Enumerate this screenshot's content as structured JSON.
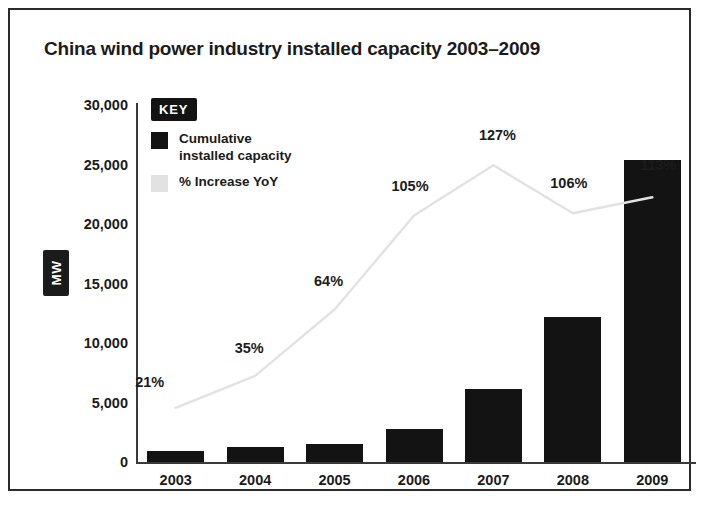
{
  "chart_data": {
    "type": "bar",
    "title": "China wind power industry installed capacity 2003–2009",
    "xlabel": "",
    "ylabel": "MW",
    "categories": [
      "2003",
      "2004",
      "2005",
      "2006",
      "2007",
      "2008",
      "2009"
    ],
    "ylim": [
      0,
      30000
    ],
    "yticks": [
      "30,000",
      "25,000",
      "20,000",
      "15,000",
      "10,000",
      "5,000",
      "0"
    ],
    "ytick_values": [
      30000,
      25000,
      20000,
      15000,
      10000,
      5000,
      0
    ],
    "grid": false,
    "legend_position": "inside-top-left",
    "series": [
      {
        "name": "Cumulative\ninstalled capacity",
        "type": "bar",
        "color": "#131313",
        "axis": "left",
        "values": [
          900,
          1250,
          1550,
          2800,
          6100,
          12200,
          25400
        ]
      },
      {
        "name": "% Increase YoY",
        "type": "line",
        "color": "#e2e2e2",
        "axis": "right",
        "unit": "%",
        "values": [
          21,
          35,
          64,
          105,
          127,
          106,
          113
        ],
        "labels": [
          "21%",
          "35%",
          "64%",
          "105%",
          "127%",
          "106%",
          "113%"
        ]
      }
    ]
  },
  "figure": {
    "title": "China wind power industry installed capacity 2003–2009",
    "y_axis_badge": "MW"
  },
  "key": {
    "heading": "KEY",
    "items": [
      {
        "label": "Cumulative\ninstalled capacity",
        "swatch": "solid-black-square",
        "color": "#131313"
      },
      {
        "label": "% Increase YoY",
        "swatch": "light-grey-square",
        "color": "#e2e2e2"
      }
    ]
  },
  "y_ticks": [
    {
      "label": "30,000",
      "value": 30000
    },
    {
      "label": "25,000",
      "value": 25000
    },
    {
      "label": "20,000",
      "value": 20000
    },
    {
      "label": "15,000",
      "value": 15000
    },
    {
      "label": "10,000",
      "value": 10000
    },
    {
      "label": "5,000",
      "value": 5000
    },
    {
      "label": "0",
      "value": 0
    }
  ],
  "x_ticks": [
    {
      "label": "2003"
    },
    {
      "label": "2004"
    },
    {
      "label": "2005"
    },
    {
      "label": "2006"
    },
    {
      "label": "2007"
    },
    {
      "label": "2008"
    },
    {
      "label": "2009"
    }
  ],
  "pct_labels": [
    {
      "label": "21%"
    },
    {
      "label": "35%"
    },
    {
      "label": "64%"
    },
    {
      "label": "105%"
    },
    {
      "label": "127%"
    },
    {
      "label": "106%"
    },
    {
      "label": "113%"
    }
  ],
  "colors": {
    "bar": "#131313",
    "line": "#e2e2e2",
    "axis": "#3a3a3a",
    "text": "#1b1b1b",
    "frame": "#2b2b2b",
    "background": "#ffffff"
  }
}
